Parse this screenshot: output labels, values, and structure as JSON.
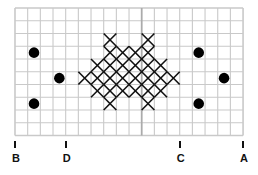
{
  "grid": {
    "cols": 18,
    "rows": 10,
    "origin_x": 15,
    "origin_y": 8,
    "cell_w": 12.67,
    "cell_h": 12.75,
    "line_color": "#c9c9c9",
    "center_line_color": "#ababab",
    "center_col": 10
  },
  "stitches": {
    "color": "#111111",
    "rows": [
      {
        "row": 2,
        "cols": [
          7,
          10
        ]
      },
      {
        "row": 3,
        "cols": [
          7,
          8,
          9,
          10
        ]
      },
      {
        "row": 4,
        "cols": [
          6,
          7,
          8,
          9,
          10,
          11
        ]
      },
      {
        "row": 5,
        "cols": [
          5,
          6,
          7,
          8,
          9,
          10,
          11,
          12
        ]
      },
      {
        "row": 6,
        "cols": [
          6,
          7,
          8,
          9,
          10,
          11
        ]
      },
      {
        "row": 7,
        "cols": [
          7,
          10
        ]
      }
    ]
  },
  "dots": {
    "color": "#000000",
    "items": [
      {
        "col": 1,
        "row": 3
      },
      {
        "col": 3,
        "row": 5
      },
      {
        "col": 1,
        "row": 7
      },
      {
        "col": 14,
        "row": 3
      },
      {
        "col": 16,
        "row": 5
      },
      {
        "col": 14,
        "row": 7
      }
    ]
  },
  "markers": [
    {
      "label": "B",
      "grid_line": 0
    },
    {
      "label": "D",
      "grid_line": 4
    },
    {
      "label": "C",
      "grid_line": 13
    },
    {
      "label": "A",
      "grid_line": 18
    }
  ]
}
